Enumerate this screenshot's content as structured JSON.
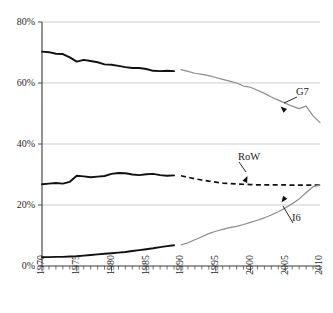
{
  "chart_data": {
    "type": "line",
    "title": "",
    "subtitle": "",
    "xlabel": "",
    "ylabel": "",
    "xlim": [
      1970,
      2010
    ],
    "ylim": [
      0,
      80
    ],
    "grid": true,
    "grid_axis": "y",
    "legend_position": "inline-annotations",
    "y_tick_labels": [
      "0%",
      "20%",
      "40%",
      "60%",
      "80%"
    ],
    "y_tick_values": [
      0,
      20,
      40,
      60,
      80
    ],
    "x_tick_labels": [
      "1970",
      "1975",
      "1980",
      "1985",
      "1990",
      "1995",
      "2000",
      "2005",
      "2010"
    ],
    "x_tick_values": [
      1970,
      1975,
      1980,
      1985,
      1990,
      1995,
      2000,
      2005,
      2010
    ],
    "x_minor_tick_step": 1,
    "annotations": [
      {
        "text": "G7",
        "x": 2008,
        "y": 55
      },
      {
        "text": "RoW",
        "x": 2001,
        "y": 33
      },
      {
        "text": "I6",
        "x": 2007,
        "y": 16
      }
    ],
    "series": [
      {
        "name": "G7",
        "label": "G7",
        "color": "#111111",
        "style": "solid-historical",
        "x": [
          1970,
          1971,
          1972,
          1973,
          1974,
          1975,
          1976,
          1977,
          1978,
          1979,
          1980,
          1981,
          1982,
          1983,
          1984,
          1985,
          1986,
          1987,
          1988,
          1989
        ],
        "values": [
          70.3,
          70.1,
          69.6,
          69.5,
          68.4,
          67.0,
          67.6,
          67.2,
          66.8,
          66.1,
          66.0,
          65.6,
          65.2,
          64.9,
          64.9,
          64.6,
          64.0,
          63.9,
          64.0,
          63.9
        ]
      },
      {
        "name": "G7-projected",
        "label": "G7",
        "color": "#8c8c8c",
        "style": "thin-grey",
        "x": [
          1990,
          1991,
          1992,
          1993,
          1994,
          1995,
          1996,
          1997,
          1998,
          1999,
          2000,
          2001,
          2002,
          2003,
          2004,
          2005,
          2006,
          2007,
          2008,
          2009,
          2010
        ],
        "values": [
          64.4,
          63.8,
          63.2,
          62.8,
          62.4,
          61.8,
          61.2,
          60.6,
          60.0,
          59.0,
          58.6,
          57.6,
          56.6,
          55.4,
          54.4,
          53.4,
          52.4,
          51.6,
          52.4,
          49.2,
          47.0
        ]
      },
      {
        "name": "RoW",
        "label": "RoW",
        "color": "#111111",
        "style": "solid-historical",
        "x": [
          1970,
          1971,
          1972,
          1973,
          1974,
          1975,
          1976,
          1977,
          1978,
          1979,
          1980,
          1981,
          1982,
          1983,
          1984,
          1985,
          1986,
          1987,
          1988,
          1989
        ],
        "values": [
          26.8,
          27.0,
          27.2,
          27.0,
          27.6,
          29.6,
          29.4,
          29.1,
          29.3,
          29.5,
          30.2,
          30.5,
          30.4,
          30.0,
          29.8,
          30.1,
          30.2,
          29.8,
          29.6,
          29.7
        ]
      },
      {
        "name": "RoW-projected",
        "label": "RoW",
        "color": "#111111",
        "style": "dashed",
        "x": [
          1990,
          1991,
          1992,
          1993,
          1994,
          1995,
          1996,
          1997,
          1998,
          1999,
          2000,
          2001,
          2002,
          2003,
          2004,
          2005,
          2006,
          2007,
          2008,
          2009,
          2010
        ],
        "values": [
          29.6,
          29.1,
          28.6,
          28.2,
          27.8,
          27.5,
          27.2,
          27.0,
          26.9,
          26.8,
          26.7,
          26.6,
          26.6,
          26.6,
          26.6,
          26.6,
          26.5,
          26.5,
          26.5,
          26.5,
          26.5
        ]
      },
      {
        "name": "I6",
        "label": "I6",
        "color": "#111111",
        "style": "solid-historical",
        "x": [
          1970,
          1971,
          1972,
          1973,
          1974,
          1975,
          1976,
          1977,
          1978,
          1979,
          1980,
          1981,
          1982,
          1983,
          1984,
          1985,
          1986,
          1987,
          1988,
          1989
        ],
        "values": [
          2.9,
          2.9,
          3.0,
          3.0,
          3.1,
          3.2,
          3.4,
          3.6,
          3.8,
          4.0,
          4.2,
          4.4,
          4.6,
          4.9,
          5.2,
          5.5,
          5.8,
          6.2,
          6.5,
          6.8
        ]
      },
      {
        "name": "I6-projected",
        "label": "I6",
        "color": "#8c8c8c",
        "style": "thin-grey",
        "x": [
          1990,
          1991,
          1992,
          1993,
          1994,
          1995,
          1996,
          1997,
          1998,
          1999,
          2000,
          2001,
          2002,
          2003,
          2004,
          2005,
          2006,
          2007,
          2008,
          2009,
          2010
        ],
        "values": [
          6.9,
          7.6,
          8.6,
          9.6,
          10.6,
          11.4,
          12.0,
          12.6,
          13.0,
          13.6,
          14.3,
          15.0,
          15.8,
          16.7,
          17.8,
          19.0,
          20.4,
          22.0,
          24.0,
          26.0,
          26.5
        ]
      }
    ]
  }
}
